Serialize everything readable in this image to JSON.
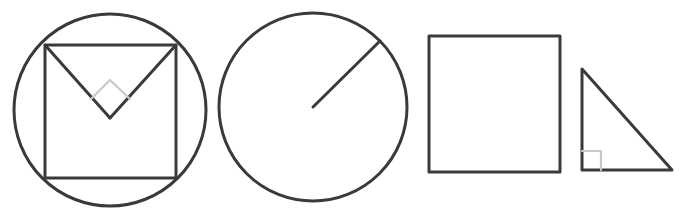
{
  "canvas": {
    "width": 690,
    "height": 214,
    "background_color": "#ffffff",
    "stroke_color": "#3a3a3a",
    "marker_color": "#c9c9c9",
    "stroke_width": 3,
    "marker_stroke_width": 2.2,
    "description": "Four hand-drawn style black-outline geometry figures arranged left to right on a plain white background"
  },
  "figures": [
    {
      "id": "figure-1",
      "name": "circle-with-inscribed-square-and-chords",
      "label": "Circle with inscribed square and two chords meeting at a right angle",
      "parts": [
        {
          "name": "circumscribed-circle",
          "shape": "circle",
          "cx": 110,
          "cy": 110,
          "r": 96
        },
        {
          "name": "inscribed-square",
          "shape": "rect",
          "x": 45,
          "y": 45,
          "width": 131,
          "height": 133
        },
        {
          "name": "chord-left",
          "shape": "line",
          "x1": 45,
          "y1": 45,
          "x2": 110,
          "y2": 118
        },
        {
          "name": "chord-right",
          "shape": "line",
          "x1": 176,
          "y1": 45,
          "x2": 110,
          "y2": 118
        },
        {
          "name": "right-angle-marker-diamond",
          "shape": "polyline",
          "points": "91,99 110,80 130,99"
        }
      ]
    },
    {
      "id": "figure-2",
      "name": "circle-with-radius",
      "label": "Circle with a radius drawn from the centre to the upper right of the circumference",
      "parts": [
        {
          "name": "circle-outline",
          "shape": "circle",
          "cx": 313,
          "cy": 107,
          "r": 94
        },
        {
          "name": "radius-line",
          "shape": "line",
          "x1": 313,
          "y1": 107,
          "x2": 380,
          "y2": 41
        }
      ]
    },
    {
      "id": "figure-3",
      "name": "plain-square",
      "label": "Plain square outline",
      "parts": [
        {
          "name": "square-outline",
          "shape": "rect",
          "x": 429,
          "y": 36,
          "width": 131,
          "height": 136
        }
      ]
    },
    {
      "id": "figure-4",
      "name": "right-triangle",
      "label": "Right triangle with a right-angle marker at the bottom-left vertex",
      "parts": [
        {
          "name": "triangle-outline",
          "shape": "polygon",
          "points": "582,69 582,170 672,170"
        },
        {
          "name": "right-angle-marker-square",
          "shape": "polyline",
          "points": "582,151 601,151 601,170"
        }
      ]
    }
  ]
}
